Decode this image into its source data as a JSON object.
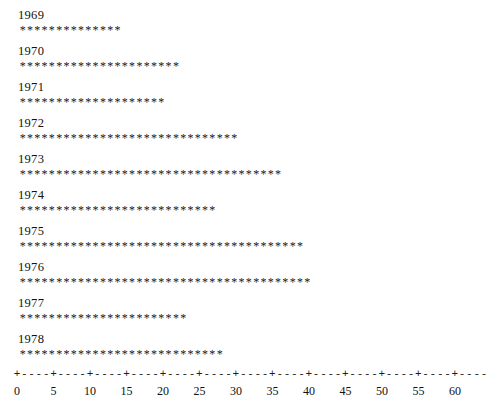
{
  "chart_data": {
    "type": "bar",
    "orientation": "horizontal",
    "style": "ascii-star-plot",
    "title": "",
    "subtitle": "",
    "xlabel": "",
    "ylabel": "",
    "categories": [
      "1969",
      "1970",
      "1971",
      "1972",
      "1973",
      "1974",
      "1975",
      "1976",
      "1977",
      "1978"
    ],
    "values": [
      14,
      22,
      20,
      30,
      36,
      27,
      39,
      40,
      23,
      28
    ],
    "series": [
      {
        "name": "",
        "values": [
          14,
          22,
          20,
          30,
          36,
          27,
          39,
          40,
          23,
          28
        ]
      }
    ],
    "xlim": [
      0,
      60
    ],
    "xticks": [
      0,
      5,
      10,
      15,
      20,
      25,
      30,
      35,
      40,
      45,
      50,
      55,
      60
    ],
    "xtick_labels": [
      "0",
      "5",
      "10",
      "15",
      "20",
      "25",
      "30",
      "35",
      "40",
      "45",
      "50",
      "55",
      "60"
    ],
    "tick_glyph": "+",
    "axis_fill_glyph": "-",
    "bar_glyph": "*",
    "grid": false,
    "legend": null
  },
  "axis": {
    "tick_char": "+",
    "fill_char": "-",
    "trailing_fill": 4,
    "min": 0,
    "max": 60,
    "step": 5
  },
  "marks": {
    "star_char": "*"
  }
}
